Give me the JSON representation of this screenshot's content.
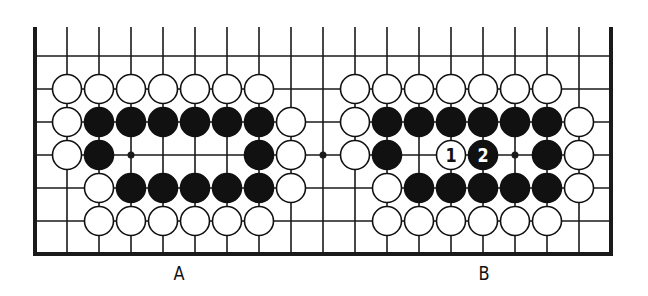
{
  "board": {
    "origin_x": 35,
    "origin_y": 56,
    "col_pitch": 32,
    "row_pitch": 33,
    "columns": 19,
    "rows": 7,
    "top_line_extent": 27,
    "line_color": "#1a1a1a",
    "stone_radius": 14.5,
    "black_color": "#111111",
    "white_color": "#ffffff",
    "star_points": [
      [
        3,
        3
      ],
      [
        9,
        3
      ],
      [
        15,
        3
      ]
    ]
  },
  "diagrams": [
    {
      "label": "A",
      "label_x": 179,
      "stones": [
        {
          "c": 1,
          "r": 1,
          "color": "white"
        },
        {
          "c": 2,
          "r": 1,
          "color": "white"
        },
        {
          "c": 3,
          "r": 1,
          "color": "white"
        },
        {
          "c": 4,
          "r": 1,
          "color": "white"
        },
        {
          "c": 5,
          "r": 1,
          "color": "white"
        },
        {
          "c": 6,
          "r": 1,
          "color": "white"
        },
        {
          "c": 7,
          "r": 1,
          "color": "white"
        },
        {
          "c": 1,
          "r": 2,
          "color": "white"
        },
        {
          "c": 2,
          "r": 2,
          "color": "black"
        },
        {
          "c": 3,
          "r": 2,
          "color": "black"
        },
        {
          "c": 4,
          "r": 2,
          "color": "black"
        },
        {
          "c": 5,
          "r": 2,
          "color": "black"
        },
        {
          "c": 6,
          "r": 2,
          "color": "black"
        },
        {
          "c": 7,
          "r": 2,
          "color": "black"
        },
        {
          "c": 8,
          "r": 2,
          "color": "white"
        },
        {
          "c": 1,
          "r": 3,
          "color": "white"
        },
        {
          "c": 2,
          "r": 3,
          "color": "black"
        },
        {
          "c": 7,
          "r": 3,
          "color": "black"
        },
        {
          "c": 8,
          "r": 3,
          "color": "white"
        },
        {
          "c": 2,
          "r": 4,
          "color": "white"
        },
        {
          "c": 3,
          "r": 4,
          "color": "black"
        },
        {
          "c": 4,
          "r": 4,
          "color": "black"
        },
        {
          "c": 5,
          "r": 4,
          "color": "black"
        },
        {
          "c": 6,
          "r": 4,
          "color": "black"
        },
        {
          "c": 7,
          "r": 4,
          "color": "black"
        },
        {
          "c": 8,
          "r": 4,
          "color": "white"
        },
        {
          "c": 2,
          "r": 5,
          "color": "white"
        },
        {
          "c": 3,
          "r": 5,
          "color": "white"
        },
        {
          "c": 4,
          "r": 5,
          "color": "white"
        },
        {
          "c": 5,
          "r": 5,
          "color": "white"
        },
        {
          "c": 6,
          "r": 5,
          "color": "white"
        },
        {
          "c": 7,
          "r": 5,
          "color": "white"
        }
      ]
    },
    {
      "label": "B",
      "label_x": 484,
      "stones": [
        {
          "c": 10,
          "r": 1,
          "color": "white"
        },
        {
          "c": 11,
          "r": 1,
          "color": "white"
        },
        {
          "c": 12,
          "r": 1,
          "color": "white"
        },
        {
          "c": 13,
          "r": 1,
          "color": "white"
        },
        {
          "c": 14,
          "r": 1,
          "color": "white"
        },
        {
          "c": 15,
          "r": 1,
          "color": "white"
        },
        {
          "c": 16,
          "r": 1,
          "color": "white"
        },
        {
          "c": 10,
          "r": 2,
          "color": "white"
        },
        {
          "c": 11,
          "r": 2,
          "color": "black"
        },
        {
          "c": 12,
          "r": 2,
          "color": "black"
        },
        {
          "c": 13,
          "r": 2,
          "color": "black"
        },
        {
          "c": 14,
          "r": 2,
          "color": "black"
        },
        {
          "c": 15,
          "r": 2,
          "color": "black"
        },
        {
          "c": 16,
          "r": 2,
          "color": "black"
        },
        {
          "c": 17,
          "r": 2,
          "color": "white"
        },
        {
          "c": 10,
          "r": 3,
          "color": "white"
        },
        {
          "c": 11,
          "r": 3,
          "color": "black"
        },
        {
          "c": 13,
          "r": 3,
          "color": "white",
          "number": "1"
        },
        {
          "c": 14,
          "r": 3,
          "color": "black",
          "number": "2"
        },
        {
          "c": 16,
          "r": 3,
          "color": "black"
        },
        {
          "c": 17,
          "r": 3,
          "color": "white"
        },
        {
          "c": 11,
          "r": 4,
          "color": "white"
        },
        {
          "c": 12,
          "r": 4,
          "color": "black"
        },
        {
          "c": 13,
          "r": 4,
          "color": "black"
        },
        {
          "c": 14,
          "r": 4,
          "color": "black"
        },
        {
          "c": 15,
          "r": 4,
          "color": "black"
        },
        {
          "c": 16,
          "r": 4,
          "color": "black"
        },
        {
          "c": 17,
          "r": 4,
          "color": "white"
        },
        {
          "c": 11,
          "r": 5,
          "color": "white"
        },
        {
          "c": 12,
          "r": 5,
          "color": "white"
        },
        {
          "c": 13,
          "r": 5,
          "color": "white"
        },
        {
          "c": 14,
          "r": 5,
          "color": "white"
        },
        {
          "c": 15,
          "r": 5,
          "color": "white"
        },
        {
          "c": 16,
          "r": 5,
          "color": "white"
        }
      ]
    }
  ]
}
